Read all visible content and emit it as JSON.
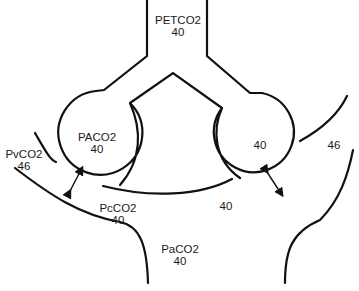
{
  "diagram": {
    "colors": {
      "line": "#111111",
      "text": "#1a1a1a",
      "background": "#ffffff"
    },
    "labels": {
      "petco2": {
        "name": "PETCO2",
        "value": "40"
      },
      "paco2_alveolar": {
        "name": "PACO2",
        "value": "40"
      },
      "right_alveolus": {
        "value": "40"
      },
      "pvco2": {
        "name": "PvCO2",
        "value": "46"
      },
      "right_venous": {
        "value": "46"
      },
      "pcco2": {
        "name": "PcCO2",
        "value": "40"
      },
      "right_capillary": {
        "value": "40"
      },
      "paco2_arterial": {
        "name": "PaCO2",
        "value": "40"
      }
    },
    "arrows": [
      {
        "name": "left-diffusion-arrow",
        "direction": "bidirectional"
      },
      {
        "name": "right-diffusion-arrow",
        "direction": "bidirectional"
      }
    ]
  }
}
